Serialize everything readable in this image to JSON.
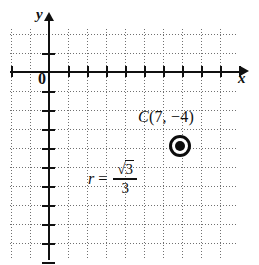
{
  "figure": {
    "type": "coordinate-plane-diagram",
    "background_color": "#ffffff",
    "ink_color": "#101010",
    "grid_color": "#707070"
  },
  "axes": {
    "x_label": "x",
    "y_label": "y",
    "origin_label": "0",
    "x_arrow": "right-arrow-icon",
    "y_arrow": "up-arrow-icon",
    "x_tick_count": 10,
    "y_tick_count": 10,
    "tick_spacing_px": 19,
    "origin_px": {
      "x": 49,
      "y": 72
    }
  },
  "grid": {
    "style": "dotted",
    "spacing_px": 19,
    "columns": 12,
    "rows": 12
  },
  "annotations": {
    "center_point": {
      "label_prefix": "C",
      "open_paren": "(",
      "x_value": "7",
      "comma": ", ",
      "y_value": "−4",
      "close_paren": ")",
      "full_label": "C(7, −4)",
      "marker": "circle-with-center-dot"
    },
    "radius": {
      "variable": "r",
      "equals": "=",
      "numerator_radical": "√",
      "numerator_radicand": "3",
      "denominator": "3",
      "full_label": "r = √3/3"
    }
  },
  "chart_data": {
    "type": "scatter",
    "title": "",
    "xlabel": "x",
    "ylabel": "y",
    "grid": true,
    "legend": "none",
    "points": [
      {
        "label": "C(7, −4)",
        "x": 7,
        "y": -4,
        "marker": "ring-with-dot"
      }
    ],
    "annotations": [
      "r = √3/3"
    ]
  }
}
